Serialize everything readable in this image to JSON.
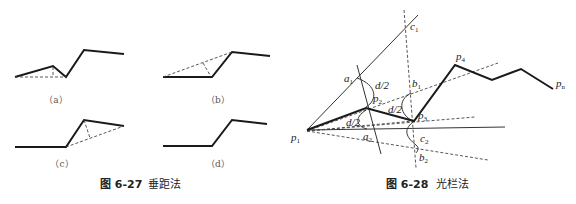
{
  "figure_6_27": {
    "caption_number": "图 6-27",
    "caption_title": "垂距法",
    "subfigures": [
      {
        "label": "（a）"
      },
      {
        "label": "（b）"
      },
      {
        "label": "（c）"
      },
      {
        "label": "（d）"
      }
    ]
  },
  "figure_6_28": {
    "caption_number": "图 6-28",
    "caption_title": "光栏法",
    "labels": {
      "p1": {
        "base": "p",
        "sub": "1"
      },
      "p2": {
        "base": "p",
        "sub": "2"
      },
      "p3": {
        "base": "p",
        "sub": "3"
      },
      "p4": {
        "base": "p",
        "sub": "4"
      },
      "pn": {
        "base": "p",
        "sub": "n"
      },
      "a1": {
        "base": "a",
        "sub": "1"
      },
      "a2": {
        "base": "a",
        "sub": "2"
      },
      "b1": {
        "base": "b",
        "sub": "1"
      },
      "b2": {
        "base": "b",
        "sub": "2"
      },
      "c1": {
        "base": "c",
        "sub": "1"
      },
      "c2": {
        "base": "c",
        "sub": "2"
      },
      "d_half": "d/2"
    }
  }
}
